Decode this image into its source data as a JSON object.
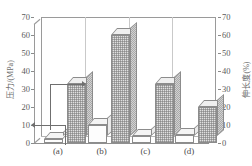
{
  "chart_data": {
    "type": "bar",
    "title": "",
    "subtitle": "",
    "categories": [
      "(a)",
      "(b)",
      "(c)",
      "(d)"
    ],
    "series": [
      {
        "name": "压力",
        "axis": "left",
        "unit": "MPa",
        "style": "white",
        "values": [
          2,
          10,
          4,
          4.5
        ]
      },
      {
        "name": "伸长度",
        "axis": "right",
        "unit": "%",
        "style": "shaded",
        "values": [
          33,
          60,
          33,
          20
        ]
      }
    ],
    "xlabel": "",
    "ylabel_left": "压力/(MPa)",
    "ylabel_right": "伸长度(%)",
    "ylim_left": [
      0,
      70
    ],
    "ylim_right": [
      0,
      70
    ],
    "yticks_left": [
      0,
      10,
      20,
      30,
      40,
      50,
      60,
      70
    ],
    "yticks_right": [
      0,
      10,
      20,
      30,
      40,
      50,
      60,
      70
    ],
    "grid": false,
    "legend": "none",
    "annotations": [
      {
        "name": "left-axis-arrow",
        "direction": "left",
        "points_to": "压力/(MPa)",
        "value_level": 10
      },
      {
        "name": "right-axis-arrow",
        "direction": "right",
        "points_to": "伸长度(%)",
        "value_level": 33
      }
    ]
  },
  "axes": {
    "left": {
      "title": "压力/(MPa)",
      "ticks": [
        "0",
        "10",
        "20",
        "30",
        "40",
        "50",
        "60",
        "70"
      ]
    },
    "right": {
      "title": "伸长度(%)",
      "ticks": [
        "0",
        "10",
        "20",
        "30",
        "40",
        "50",
        "60",
        "70"
      ]
    },
    "x": {
      "labels": [
        "(a)",
        "(b)",
        "(c)",
        "(d)"
      ]
    }
  },
  "colors": {
    "frame": "#9a9a9a",
    "separator": "#c9c9c9",
    "bar_outline": "#8c8c8c",
    "bar_white": "#fdfdfd",
    "bar_shaded": "#e0e0e0",
    "text": "#4d4d4d",
    "background": "#ffffff"
  }
}
